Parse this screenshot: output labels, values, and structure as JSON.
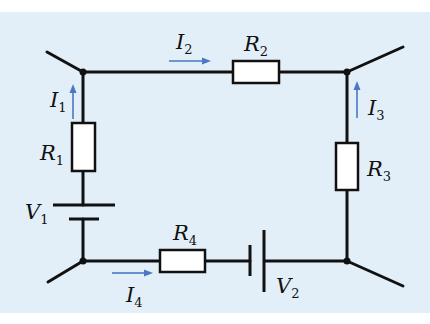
{
  "diagram": {
    "type": "circuit",
    "colors": {
      "background": "#e3eff8",
      "wire": "#111111",
      "current_arrow": "#4a78c4",
      "resistor_fill": "#ffffff"
    },
    "resistors": [
      {
        "id": "R1",
        "letter": "R",
        "sub": "1"
      },
      {
        "id": "R2",
        "letter": "R",
        "sub": "2"
      },
      {
        "id": "R3",
        "letter": "R",
        "sub": "3"
      },
      {
        "id": "R4",
        "letter": "R",
        "sub": "4"
      }
    ],
    "sources": [
      {
        "id": "V1",
        "letter": "V",
        "sub": "1"
      },
      {
        "id": "V2",
        "letter": "V",
        "sub": "2"
      }
    ],
    "currents": [
      {
        "id": "I1",
        "letter": "I",
        "sub": "1",
        "direction": "up"
      },
      {
        "id": "I2",
        "letter": "I",
        "sub": "2",
        "direction": "right"
      },
      {
        "id": "I3",
        "letter": "I",
        "sub": "3",
        "direction": "up"
      },
      {
        "id": "I4",
        "letter": "I",
        "sub": "4",
        "direction": "right"
      }
    ],
    "nodes": [
      "top-left",
      "top-right",
      "bottom-left",
      "bottom-right"
    ]
  }
}
